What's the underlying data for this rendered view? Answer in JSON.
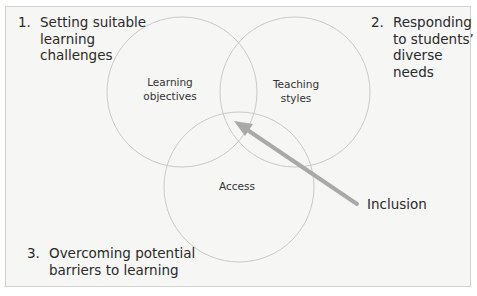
{
  "diagram": {
    "type": "venn",
    "corner_notes": [
      {
        "number": "1.",
        "text": "Setting suitable\nlearning\nchallenges"
      },
      {
        "number": "2.",
        "text": "Responding\nto students’\ndiverse needs"
      },
      {
        "number": "3.",
        "text": "Overcoming potential\nbarriers to learning"
      }
    ],
    "circles": [
      {
        "label": "Learning\nobjectives"
      },
      {
        "label": "Teaching\nstyles"
      },
      {
        "label": "Access"
      }
    ],
    "arrow_label": "Inclusion",
    "colors": {
      "background": "#f6f6f5",
      "circle_stroke": "#c9c9c9",
      "arrow": "#a9a9a9",
      "text": "#2a2a2a"
    }
  }
}
